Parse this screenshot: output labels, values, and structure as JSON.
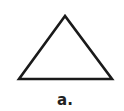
{
  "figure": {
    "shape": "triangle",
    "caption": "a.",
    "stroke_color": "#1a1a1a",
    "fill_color": "#ffffff",
    "vertices": {
      "apex": [
        65,
        16
      ],
      "bottom_left": [
        19,
        79
      ],
      "bottom_right": [
        112,
        79
      ]
    }
  }
}
